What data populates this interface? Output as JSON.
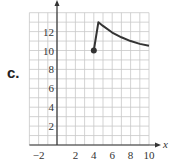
{
  "problem_label": "c.",
  "chart_data": {
    "type": "line",
    "title": "",
    "xlabel": "x",
    "ylabel": "",
    "xlim": [
      -3,
      10
    ],
    "ylim": [
      0,
      14
    ],
    "grid": true,
    "x_tick_labels": [
      "-2",
      "2",
      "4",
      "6",
      "8",
      "10"
    ],
    "y_tick_labels": [
      "2",
      "4",
      "6",
      "8",
      "10",
      "12"
    ],
    "series": [
      {
        "name": "f(x)",
        "points": [
          [
            4,
            10
          ],
          [
            4.5,
            13
          ],
          [
            5,
            12.6
          ],
          [
            6,
            11.9
          ],
          [
            7,
            11.4
          ],
          [
            8,
            11.0
          ],
          [
            9,
            10.7
          ],
          [
            10,
            10.5
          ]
        ],
        "start_marker": "closed-dot"
      }
    ]
  }
}
